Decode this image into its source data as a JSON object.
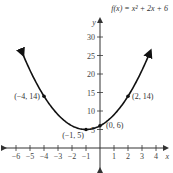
{
  "chart_data": {
    "type": "line",
    "title": "f(x) = x² + 2x + 6",
    "xlabel": "x",
    "ylabel": "y",
    "xlim": [
      -6.5,
      5
    ],
    "ylim": [
      -2,
      36
    ],
    "grid": false,
    "x_ticks": [
      -6,
      -5,
      -4,
      -3,
      -2,
      -1,
      1,
      2,
      3,
      4
    ],
    "y_ticks": [
      5,
      10,
      15,
      20,
      25,
      30
    ],
    "function": "x^2 + 2x + 6",
    "series": [
      {
        "name": "f(x) = x² + 2x + 6",
        "x": [
          -6,
          -5,
          -4,
          -3,
          -2,
          -1,
          0,
          1,
          2,
          3,
          4
        ],
        "values": [
          30,
          21,
          14,
          9,
          6,
          5,
          6,
          9,
          14,
          21,
          30
        ]
      }
    ],
    "labeled_points": [
      {
        "x": -4,
        "y": 14,
        "label": "(−4, 14)"
      },
      {
        "x": -1,
        "y": 5,
        "label": "(−1, 5)"
      },
      {
        "x": 0,
        "y": 6,
        "label": "(0, 6)"
      },
      {
        "x": 2,
        "y": 14,
        "label": "(2, 14)"
      }
    ]
  },
  "colors": {
    "curve": "#111111",
    "axis": "#333333",
    "text": "#444444"
  }
}
